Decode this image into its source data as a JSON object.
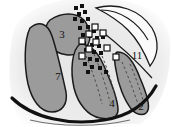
{
  "figure": {
    "type": "anatomical-section-diagram",
    "width": 171,
    "height": 127,
    "background_color": "#ffffff",
    "haze_color": "#e9e9e9",
    "lobe_fill_color": "#9b9b9b",
    "lobe_stroke_color": "#1a1a1a",
    "unfilled_region_color": "#fafafa",
    "marker_filled_color": "#111111",
    "marker_open_color": "#ffffff",
    "dashed_line_color": "#4a4a4a"
  },
  "labels": [
    {
      "id": "label-3",
      "text": "3",
      "x": 62,
      "y": 34
    },
    {
      "id": "label-7",
      "text": "7",
      "x": 58,
      "y": 76
    },
    {
      "id": "label-4",
      "text": "4",
      "x": 112,
      "y": 103
    },
    {
      "id": "label-2",
      "text": "2",
      "x": 141,
      "y": 106
    },
    {
      "id": "label-11",
      "text": "11",
      "x": 135,
      "y": 55
    }
  ],
  "regions": [
    {
      "id": "region-3",
      "label": "3",
      "fill": "#9b9b9b",
      "description": "upper-central gray lobe"
    },
    {
      "id": "region-7",
      "label": "7",
      "fill": "#9b9b9b",
      "description": "large left gray lobe"
    },
    {
      "id": "region-4",
      "label": "4",
      "fill": "#9b9b9b",
      "description": "lower-central gray lobe with dashed striations"
    },
    {
      "id": "region-2",
      "label": "2",
      "fill": "#9b9b9b",
      "description": "right narrow gray lobe with dashed striations"
    },
    {
      "id": "region-11",
      "label": "11",
      "fill": "#fafafa",
      "description": "upper-right unfilled outlined region"
    }
  ],
  "markers": {
    "filled_squares": [
      {
        "x": 74,
        "y": 6,
        "size": 4
      },
      {
        "x": 80,
        "y": 4,
        "size": 4
      },
      {
        "x": 77,
        "y": 12,
        "size": 4
      },
      {
        "x": 83,
        "y": 10,
        "size": 4
      },
      {
        "x": 73,
        "y": 17,
        "size": 4
      },
      {
        "x": 80,
        "y": 19,
        "size": 4
      },
      {
        "x": 86,
        "y": 17,
        "size": 4
      },
      {
        "x": 78,
        "y": 26,
        "size": 4
      },
      {
        "x": 86,
        "y": 25,
        "size": 4
      },
      {
        "x": 92,
        "y": 29,
        "size": 4
      },
      {
        "x": 81,
        "y": 33,
        "size": 4
      },
      {
        "x": 88,
        "y": 34,
        "size": 4
      },
      {
        "x": 95,
        "y": 36,
        "size": 4
      },
      {
        "x": 101,
        "y": 35,
        "size": 4
      },
      {
        "x": 82,
        "y": 41,
        "size": 4
      },
      {
        "x": 90,
        "y": 43,
        "size": 4
      },
      {
        "x": 97,
        "y": 44,
        "size": 4
      },
      {
        "x": 84,
        "y": 48,
        "size": 4
      },
      {
        "x": 92,
        "y": 50,
        "size": 4
      },
      {
        "x": 99,
        "y": 51,
        "size": 4
      },
      {
        "x": 80,
        "y": 54,
        "size": 4
      },
      {
        "x": 88,
        "y": 57,
        "size": 4
      },
      {
        "x": 95,
        "y": 58,
        "size": 4
      },
      {
        "x": 83,
        "y": 62,
        "size": 4
      },
      {
        "x": 90,
        "y": 65,
        "size": 4
      },
      {
        "x": 98,
        "y": 66,
        "size": 4
      },
      {
        "x": 86,
        "y": 70,
        "size": 4
      },
      {
        "x": 104,
        "y": 70,
        "size": 4
      }
    ],
    "open_squares": [
      {
        "x": 92,
        "y": 24,
        "size": 6
      },
      {
        "x": 86,
        "y": 31,
        "size": 6
      },
      {
        "x": 100,
        "y": 30,
        "size": 6
      },
      {
        "x": 79,
        "y": 38,
        "size": 6
      },
      {
        "x": 93,
        "y": 39,
        "size": 6
      },
      {
        "x": 86,
        "y": 46,
        "size": 6
      },
      {
        "x": 104,
        "y": 45,
        "size": 6
      },
      {
        "x": 79,
        "y": 53,
        "size": 6
      },
      {
        "x": 113,
        "y": 54,
        "size": 6
      }
    ]
  }
}
